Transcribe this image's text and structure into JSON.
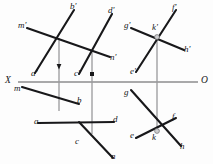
{
  "figure": {
    "canvas": {
      "width": 213,
      "height": 164
    },
    "background_color": "#fdfdfd",
    "line_color": "#18181a",
    "axis_color": "#8c8c8e",
    "projector_color": "#9a9a9c"
  },
  "ground_line": {
    "name": "x-o-ground-line",
    "left_label": "X",
    "right_label": "O",
    "y": 82,
    "x_start": 18,
    "x_end": 198
  },
  "labels": {
    "upper_left_group": {
      "b_prime": "b'",
      "m_prime": "m'",
      "a_prime": "a'",
      "d_prime": "d'",
      "n_prime": "n'",
      "c_prime": "c'"
    },
    "upper_right_group": {
      "g_prime": "g'",
      "k_prime": "k'",
      "f_prime": "f'",
      "h_prime": "h'",
      "e_prime": "e'"
    },
    "lower_left_group": {
      "m": "m",
      "b": "b",
      "a": "a",
      "c": "c",
      "d": "d",
      "n": "n"
    },
    "lower_right_group": {
      "g": "g",
      "f": "f",
      "e": "e",
      "k": "k",
      "h": "h"
    }
  },
  "segments": {
    "upper": [
      {
        "name": "line-a-prime-b-prime",
        "x1": 35,
        "y1": 73,
        "x2": 74,
        "y2": 10
      },
      {
        "name": "line-m-prime-n-prime",
        "x1": 27,
        "y1": 28,
        "x2": 110,
        "y2": 57
      },
      {
        "name": "line-c-prime-d-prime",
        "x1": 79,
        "y1": 74,
        "x2": 112,
        "y2": 14
      },
      {
        "name": "line-e-prime-f-prime",
        "x1": 136,
        "y1": 72,
        "x2": 176,
        "y2": 10
      },
      {
        "name": "line-g-prime-h-prime",
        "x1": 131,
        "y1": 28,
        "x2": 184,
        "y2": 50
      }
    ],
    "lower": [
      {
        "name": "line-m-b",
        "x1": 22,
        "y1": 87,
        "x2": 79,
        "y2": 104
      },
      {
        "name": "line-a-d",
        "x1": 38,
        "y1": 123,
        "x2": 114,
        "y2": 122
      },
      {
        "name": "line-c-n",
        "x1": 79,
        "y1": 122,
        "x2": 113,
        "y2": 158
      },
      {
        "name": "line-g-h",
        "x1": 131,
        "y1": 90,
        "x2": 181,
        "y2": 146
      },
      {
        "name": "line-e-f",
        "x1": 136,
        "y1": 138,
        "x2": 176,
        "y2": 118
      }
    ],
    "projectors": [
      {
        "name": "projector-left",
        "x": 59,
        "y1": 38,
        "y2": 111
      },
      {
        "name": "projector-middle",
        "x": 92,
        "y1": 51,
        "y2": 134
      },
      {
        "name": "projector-right",
        "x": 157,
        "y1": 37,
        "y2": 131
      }
    ]
  },
  "nodes": [
    {
      "name": "intersection-upper-left",
      "x": 59,
      "y": 38
    },
    {
      "name": "intersection-upper-middle",
      "x": 92,
      "y": 51
    },
    {
      "name": "intersection-upper-right",
      "x": 157,
      "y": 37
    },
    {
      "name": "intersection-lower-left",
      "x": 59,
      "y": 111
    },
    {
      "name": "intersection-lower-middle",
      "x": 92,
      "y": 134
    },
    {
      "name": "intersection-lower-right",
      "x": 157,
      "y": 131
    }
  ],
  "tickmarks": [
    {
      "name": "tick-projector-left",
      "x": 59,
      "y": 68
    },
    {
      "name": "tick-projector-middle",
      "x": 92,
      "y": 76
    }
  ]
}
